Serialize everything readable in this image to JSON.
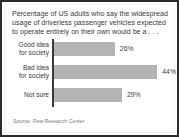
{
  "title_lines": [
    "Percentage of US adults who say the widespread",
    "usage of driverless passenger vehicles expected",
    "to operate entirely on their own would be a . . ."
  ],
  "source": "Source: Pew Research Center",
  "chart_data": {
    "type": "bar",
    "orientation": "horizontal",
    "title": "Percentage of US adults who say the widespread usage of driverless passenger vehicles expected to operate entirely on their own would be a . . .",
    "categories": [
      "Good idea for society",
      "Bad idea for society",
      "Not sure"
    ],
    "category_lines": [
      [
        "Good idea",
        "for society"
      ],
      [
        "Bad idea",
        "for society"
      ],
      [
        "Not sure"
      ]
    ],
    "values": [
      26,
      44,
      29
    ],
    "value_labels": [
      "26%",
      "44%",
      "29%"
    ],
    "xlabel": "",
    "ylabel": "",
    "xlim": [
      0,
      50
    ],
    "grid": false,
    "legend": false,
    "bar_color": "#b4b4b4",
    "axis_color": "#3a3a3a",
    "text_color": "#3a3a3a",
    "source_color": "#7a7a7a",
    "background": "#ffffff",
    "border_color": "#2b2b2b"
  }
}
